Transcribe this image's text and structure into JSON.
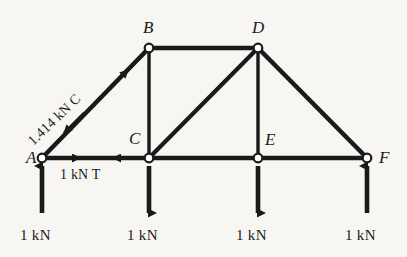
{
  "figure": {
    "type": "truss-free-body-diagram",
    "background_color": "#f7f6f3",
    "ink_color": "#1a1a1a",
    "joint_marker": "open-circle"
  },
  "joints": [
    {
      "id": "A",
      "label": "A",
      "x": 42,
      "y": 158,
      "label_x": 26,
      "label_y": 149
    },
    {
      "id": "B",
      "label": "B",
      "x": 149,
      "y": 48,
      "label_x": 143,
      "label_y": 19
    },
    {
      "id": "C",
      "label": "C",
      "x": 149,
      "y": 158,
      "label_x": 129,
      "label_y": 130
    },
    {
      "id": "D",
      "label": "D",
      "x": 258,
      "y": 48,
      "label_x": 252,
      "label_y": 19
    },
    {
      "id": "E",
      "label": "E",
      "x": 258,
      "y": 158,
      "label_x": 265,
      "label_y": 131
    },
    {
      "id": "F",
      "label": "F",
      "x": 367,
      "y": 158,
      "label_x": 379,
      "label_y": 149
    }
  ],
  "members": [
    {
      "id": "AB",
      "from": "A",
      "to": "B"
    },
    {
      "id": "BD",
      "from": "B",
      "to": "D"
    },
    {
      "id": "DF",
      "from": "D",
      "to": "F"
    },
    {
      "id": "BC",
      "from": "B",
      "to": "C"
    },
    {
      "id": "DE",
      "from": "D",
      "to": "E"
    },
    {
      "id": "CD",
      "from": "C",
      "to": "D"
    },
    {
      "id": "AC",
      "from": "A",
      "to": "C"
    },
    {
      "id": "CE",
      "from": "C",
      "to": "E"
    },
    {
      "id": "EF",
      "from": "E",
      "to": "F"
    }
  ],
  "member_forces": [
    {
      "member": "AB",
      "magnitude": "1.414",
      "unit": "kN",
      "sense": "C",
      "sense_name": "compression",
      "text": "1.414 kN C",
      "arrow_style": "outward-pair"
    },
    {
      "member": "AC",
      "magnitude": "1",
      "unit": "kN",
      "sense": "T",
      "sense_name": "tension",
      "text": "1 kN T",
      "label_x": 60,
      "label_y": 168,
      "arrow_style": "inward-pair"
    }
  ],
  "loads": [
    {
      "at": "A",
      "direction": "up",
      "text": "1 kN",
      "x": 42,
      "label_x": 20,
      "label_y": 228
    },
    {
      "at": "C",
      "direction": "down",
      "text": "1 kN",
      "x": 149,
      "label_x": 127,
      "label_y": 228
    },
    {
      "at": "E",
      "direction": "down",
      "text": "1 kN",
      "x": 258,
      "label_x": 236,
      "label_y": 228
    },
    {
      "at": "F",
      "direction": "up",
      "text": "1 kN",
      "x": 367,
      "label_x": 345,
      "label_y": 228
    }
  ]
}
